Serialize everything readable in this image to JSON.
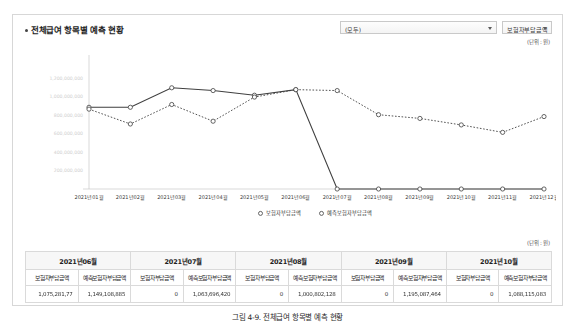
{
  "panel": {
    "title": "전체급여 항목별 예측 현황",
    "unit_chart": "(단위 : 원)",
    "unit_table": "(단위 : 원)"
  },
  "filters": {
    "category": {
      "value": "(모두)"
    },
    "measure": {
      "value": "보험자부담금액"
    }
  },
  "caption": "그림 4-9. 전체급여 항목별 예측 현황",
  "chart_data": {
    "type": "line",
    "title": "전체급여 항목별 예측 현황",
    "xlabel": "",
    "ylabel": "",
    "grid": false,
    "legend_position": "bottom",
    "ylim": [
      0,
      1400000000
    ],
    "yticks": [
      0,
      200000000,
      400000000,
      600000000,
      800000000,
      1000000000,
      1200000000
    ],
    "ytick_labels": [
      "",
      "200,000,000",
      "400,000,000",
      "600,000,000",
      "800,000,000",
      "1,000,000,000",
      "1,200,000,000"
    ],
    "categories": [
      "2021년01월",
      "2021년02월",
      "2021년03월",
      "2021년04월",
      "2021년05월",
      "2021년06월",
      "2021년07월",
      "2021년08월",
      "2021년09월",
      "2021년10월",
      "2021년11월",
      "2021년12월"
    ],
    "series": [
      {
        "name": "보험자부담금액",
        "style": "solid",
        "marker": "circle",
        "values": [
          880000000,
          880000000,
          1090000000,
          1060000000,
          1010000000,
          1070000000,
          0,
          0,
          0,
          0,
          0,
          0
        ]
      },
      {
        "name": "예측보험자부담금액",
        "style": "dotted",
        "marker": "circle",
        "values": [
          860000000,
          700000000,
          910000000,
          730000000,
          990000000,
          1070000000,
          1060000000,
          800000000,
          760000000,
          690000000,
          610000000,
          780000000
        ]
      }
    ]
  },
  "table": {
    "unit": "(단위 : 원)",
    "months": [
      "2021년06월",
      "2021년07월",
      "2021년08월",
      "2021년09월",
      "2021년10월"
    ],
    "metrics": [
      "보험자부담금액",
      "예측보험자부담금액"
    ],
    "row": [
      {
        "actual": "1,075,281,77",
        "forecast": "1,149,108,885",
        "actual_blurred": true,
        "forecast_blurred": true
      },
      {
        "actual": "0",
        "forecast": "1,063,696,420",
        "actual_blurred": false,
        "forecast_blurred": true
      },
      {
        "actual": "0",
        "forecast": "1,000,802,128",
        "actual_blurred": false,
        "forecast_blurred": true
      },
      {
        "actual": "0",
        "forecast": "1,195,087,464",
        "actual_blurred": false,
        "forecast_blurred": true
      },
      {
        "actual": "0",
        "forecast": "1,088,115,083",
        "actual_blurred": false,
        "forecast_blurred": true
      }
    ]
  }
}
